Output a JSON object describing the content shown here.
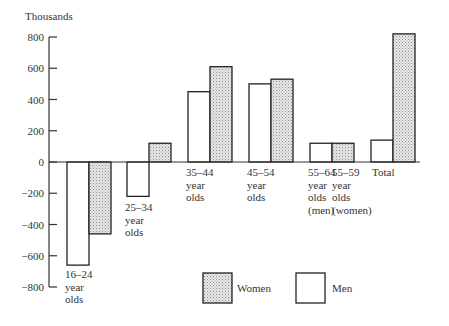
{
  "chart_data": {
    "type": "bar",
    "title": "",
    "ylabel": "Thousands",
    "xlabel": "",
    "ylim": [
      -800,
      800
    ],
    "yticks": [
      800,
      600,
      400,
      200,
      0,
      -200,
      -400,
      -600,
      -800
    ],
    "ytick_labels": [
      "800",
      "600",
      "400",
      "200",
      "0",
      "−200",
      "−400",
      "−600",
      "−800"
    ],
    "grid": false,
    "legend_position": "bottom",
    "categories": [
      {
        "lines": [
          "16–24",
          "year",
          "olds"
        ]
      },
      {
        "lines": [
          "25–34",
          "year",
          "olds"
        ]
      },
      {
        "lines": [
          "35–44",
          "year",
          "olds"
        ]
      },
      {
        "lines": [
          "45–54",
          "year",
          "olds"
        ]
      },
      {
        "lines": [
          "55–64",
          "year",
          "olds",
          "(men)"
        ]
      },
      {
        "lines": [
          "55–59",
          "year",
          "olds",
          "(women)"
        ]
      },
      {
        "lines": [
          "Total"
        ]
      }
    ],
    "category_names": [
      "16–24 year olds",
      "25–34 year olds",
      "35–44 year olds",
      "45–54 year olds",
      "55–64 year olds (men)",
      "55–59 year olds (women)",
      "Total"
    ],
    "series": [
      {
        "name": "Men",
        "pattern": "white",
        "values": [
          -660,
          -220,
          450,
          500,
          120,
          null,
          140
        ]
      },
      {
        "name": "Women",
        "pattern": "stippled",
        "values": [
          -460,
          120,
          610,
          530,
          null,
          120,
          820
        ]
      }
    ],
    "legend": [
      {
        "label": "Women",
        "pattern": "stippled"
      },
      {
        "label": "Men",
        "pattern": "white"
      }
    ],
    "colors": {
      "stipple_bg": "#e6e6e6",
      "stipple_dot": "#9a9a9a",
      "outline": "#222222"
    }
  }
}
